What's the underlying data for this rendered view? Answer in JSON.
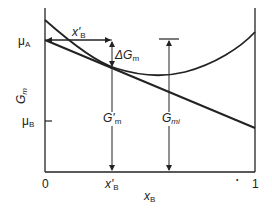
{
  "diagram": {
    "y_axis": {
      "label_main": "G",
      "label_sub": "m"
    },
    "x_axis": {
      "label_main": "x",
      "label_sub": "B",
      "tick_left": "0",
      "tick_right": "1",
      "tick_mid_main": "x'",
      "tick_mid_sub": "B"
    },
    "labels": {
      "mu_a_main": "μ",
      "mu_a_sub": "A",
      "mu_b_main": "μ",
      "mu_b_sub": "B",
      "xb_arrow_main": "x'",
      "xb_arrow_sub": "B",
      "delta_gm_main": "ΔG",
      "delta_gm_sub": "m",
      "g_prime_m_main": "G'",
      "g_prime_m_sub": "m",
      "g_mi_main": "G",
      "g_mi_sub": "mi",
      "dot": "•"
    },
    "colors": {
      "line": "#222222",
      "background": "#ffffff"
    },
    "elements": [
      "Gm curve (convex, min near x≈0.6)",
      "Tangent line at x'B from μA (x=0) to μB (x=1)",
      "Horizontal arrow x'B from μA to tangent point",
      "ΔGm double arrow",
      "G'm vertical arrow to x-axis at x'B",
      "Gmi vertical arrow with top bar"
    ]
  }
}
